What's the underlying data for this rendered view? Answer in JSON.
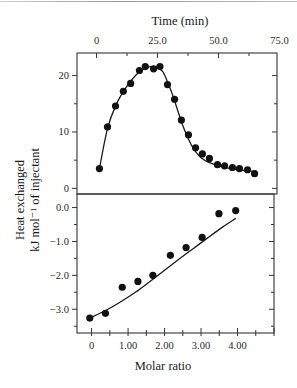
{
  "figure": {
    "top_axis_title": "Time (min)",
    "y_axis_title_line1": "Heat exchanged",
    "y_axis_title_line2": "kJ mol⁻¹ of injectant",
    "bottom_axis_title": "Molar ratio"
  },
  "chart_data": [
    {
      "type": "scatter",
      "panel": "upper",
      "title": "",
      "xlabel": "Time (min)",
      "ylabel": "Heat exchanged kJ mol^-1 of injectant",
      "x_axis_position": "top",
      "xlim": [
        -8,
        74
      ],
      "ylim": [
        -1,
        24
      ],
      "x_ticks": [
        0,
        25.0,
        50.0,
        75.0
      ],
      "x_tick_labels": [
        "0",
        "25.0",
        "50.0",
        "75.0"
      ],
      "y_ticks": [
        0,
        10,
        20
      ],
      "y_tick_labels": [
        "0",
        "10",
        "20"
      ],
      "grid": false,
      "legend": null,
      "series": [
        {
          "name": "Heat per injection (data)",
          "marker": "filled-circle",
          "x": [
            1.2,
            4.5,
            7.8,
            11.0,
            14.0,
            17.6,
            20.0,
            23.4,
            26.0,
            29.1,
            32.0,
            34.8,
            37.7,
            40.6,
            43.4,
            46.3,
            49.6,
            52.5,
            55.7,
            58.6,
            61.9,
            64.8
          ],
          "y": [
            3.5,
            10.9,
            14.6,
            17.2,
            18.6,
            20.9,
            21.6,
            21.2,
            21.6,
            18.4,
            15.8,
            12.1,
            9.5,
            7.2,
            6.1,
            5.3,
            4.2,
            4.0,
            3.7,
            3.5,
            3.3,
            2.6
          ]
        },
        {
          "name": "Fit",
          "line": "solid",
          "x": [
            1.2,
            4.5,
            8,
            12,
            16,
            20,
            24,
            27,
            29,
            31,
            33,
            35,
            37,
            39,
            41,
            43,
            46,
            50,
            54,
            58,
            62,
            64.8
          ],
          "y": [
            3.5,
            10.6,
            14.8,
            17.8,
            20.0,
            21.3,
            21.6,
            20.8,
            19.0,
            16.8,
            14.2,
            11.6,
            9.4,
            7.6,
            6.3,
            5.4,
            4.6,
            4.0,
            3.6,
            3.3,
            3.1,
            3.0
          ]
        }
      ]
    },
    {
      "type": "scatter",
      "panel": "lower",
      "title": "",
      "xlabel": "Molar ratio",
      "ylabel": "Heat exchanged kJ mol^-1 of injectant",
      "x_axis_position": "bottom",
      "xlim": [
        -0.4,
        5.0
      ],
      "ylim": [
        -3.7,
        0.4
      ],
      "x_ticks": [
        0,
        1.0,
        2.0,
        3.0,
        4.0
      ],
      "x_tick_labels": [
        "0",
        "1.00",
        "2.00",
        "3.00",
        "4.00"
      ],
      "y_ticks": [
        0.0,
        -1.0,
        -2.0,
        -3.0
      ],
      "y_tick_labels": [
        "0.0",
        "−1.0",
        "−2.0",
        "−3.0"
      ],
      "grid": false,
      "legend": null,
      "series": [
        {
          "name": "Integrated heats (data)",
          "marker": "filled-circle",
          "x": [
            -0.05,
            0.38,
            0.84,
            1.27,
            1.68,
            2.16,
            2.59,
            3.03,
            3.49,
            3.95
          ],
          "y": [
            -3.26,
            -3.12,
            -2.35,
            -2.18,
            -2.0,
            -1.41,
            -1.18,
            -0.88,
            -0.18,
            -0.09
          ]
        },
        {
          "name": "Fit",
          "line": "solid",
          "x": [
            -0.05,
            0.4,
            0.8,
            1.2,
            1.6,
            2.0,
            2.4,
            2.8,
            3.2,
            3.6,
            3.95
          ],
          "y": [
            -3.26,
            -3.03,
            -2.78,
            -2.5,
            -2.18,
            -1.85,
            -1.52,
            -1.2,
            -0.88,
            -0.57,
            -0.32
          ]
        }
      ]
    }
  ]
}
